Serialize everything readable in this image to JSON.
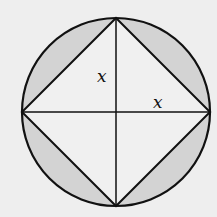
{
  "diagram": {
    "labels": {
      "half_diagonal_vertical": "x",
      "half_diagonal_horizontal": "x"
    },
    "colors": {
      "background": "#eeeeee",
      "shaded": "#d3d3d3",
      "stroke": "#111111",
      "interior": "#f0f0f0"
    }
  }
}
